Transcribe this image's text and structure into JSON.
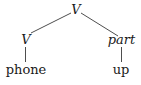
{
  "diagram": {
    "type": "syntax-tree",
    "root": {
      "label": "V",
      "style": "italic",
      "children": [
        {
          "label": "V",
          "style": "italic",
          "children": [
            {
              "label": "phone",
              "style": "roman"
            }
          ]
        },
        {
          "label": "part",
          "style": "italic",
          "children": [
            {
              "label": "up",
              "style": "roman"
            }
          ]
        }
      ]
    },
    "nodes": {
      "root": "V",
      "left_category": "V",
      "right_category": "part",
      "left_word": "phone",
      "right_word": "up"
    },
    "colors": {
      "text": "#1a1a1a",
      "edge": "#3a3a3a",
      "background": "#ffffff"
    }
  }
}
